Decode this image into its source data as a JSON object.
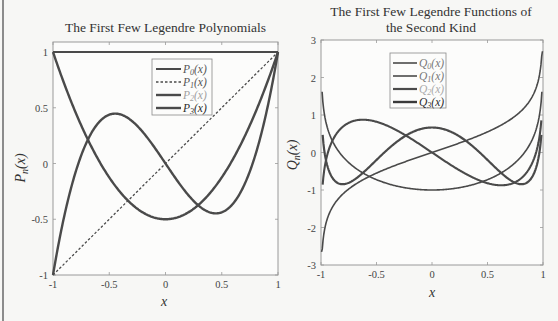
{
  "chart_data": [
    {
      "type": "line",
      "title": "The First Few Legendre Polynomials",
      "xlabel": "x",
      "ylabel": "P_n(x)",
      "xlim": [
        -1,
        1
      ],
      "ylim": [
        -1,
        1.1
      ],
      "xticks": [
        "-1",
        "-0.5",
        "0",
        "0.5",
        "1"
      ],
      "yticks": [
        "-1",
        "-0.5",
        "0",
        "0.5",
        "1"
      ],
      "grid": false,
      "legend_position": "upper center-right",
      "x": [
        -1,
        -0.75,
        -0.5,
        -0.25,
        0,
        0.25,
        0.5,
        0.75,
        1
      ],
      "series": [
        {
          "name": "P0(x)",
          "style": "solid",
          "values": [
            1,
            1,
            1,
            1,
            1,
            1,
            1,
            1,
            1
          ]
        },
        {
          "name": "P1(x)",
          "style": "dashed",
          "values": [
            -1,
            -0.75,
            -0.5,
            -0.25,
            0,
            0.25,
            0.5,
            0.75,
            1
          ]
        },
        {
          "name": "P2(x)",
          "style": "solid",
          "values": [
            1,
            0.34,
            -0.13,
            -0.41,
            -0.5,
            -0.41,
            -0.13,
            0.34,
            1
          ]
        },
        {
          "name": "P3(x)",
          "style": "solid",
          "values": [
            -1,
            0.07,
            0.44,
            0.34,
            0,
            -0.34,
            -0.44,
            -0.07,
            1
          ]
        }
      ]
    },
    {
      "type": "line",
      "title": "The First Few Legendre Functions of the Second Kind",
      "xlabel": "x",
      "ylabel": "Q_n(x)",
      "xlim": [
        -1,
        1
      ],
      "ylim": [
        -3,
        3
      ],
      "xticks": [
        "-1",
        "-0.5",
        "0",
        "0.5",
        "1"
      ],
      "yticks": [
        "-3",
        "-2",
        "-1",
        "0",
        "1",
        "2",
        "3"
      ],
      "grid": false,
      "legend_position": "upper center",
      "x": [
        -0.99,
        -0.75,
        -0.5,
        -0.25,
        0,
        0.25,
        0.5,
        0.75,
        0.99
      ],
      "series": [
        {
          "name": "Q0(x)",
          "values": [
            -2.65,
            -0.97,
            -0.55,
            -0.26,
            0,
            0.26,
            0.55,
            0.97,
            2.65
          ]
        },
        {
          "name": "Q1(x)",
          "values": [
            1.62,
            -0.27,
            -0.73,
            -0.94,
            -1,
            -0.94,
            -0.73,
            -0.27,
            1.62
          ]
        },
        {
          "name": "Q2(x)",
          "values": [
            -1.1,
            0.79,
            0.82,
            0.48,
            0,
            -0.48,
            -0.82,
            -0.79,
            1.1
          ]
        },
        {
          "name": "Q3(x)",
          "values": [
            0.7,
            -0.74,
            -0.2,
            0.43,
            0.67,
            0.43,
            -0.2,
            -0.74,
            0.7
          ]
        }
      ]
    }
  ],
  "left_chart": {
    "title": "The First Few Legendre Polynomials",
    "xlabel": "x",
    "ylabel_main": "P",
    "ylabel_sub": "n",
    "ylabel_tail": "(x)",
    "xticks": [
      "-1",
      "-0.5",
      "0",
      "0.5",
      "1"
    ],
    "yticks": [
      "-1",
      "-0.5",
      "0",
      "0.5",
      "1"
    ],
    "legend": [
      {
        "main": "P",
        "sub": "0",
        "tail": "(x)"
      },
      {
        "main": "P",
        "sub": "1",
        "tail": "(x)"
      },
      {
        "main": "P",
        "sub": "2",
        "tail": "(x)"
      },
      {
        "main": "P",
        "sub": "3",
        "tail": "(x)"
      }
    ]
  },
  "right_chart": {
    "title_line1": "The First Few Legendre Functions of",
    "title_line2": "the Second Kind",
    "xlabel": "x",
    "ylabel_main": "Q",
    "ylabel_sub": "n",
    "ylabel_tail": "(x)",
    "xticks": [
      "-1",
      "-0.5",
      "0",
      "0.5",
      "1"
    ],
    "yticks": [
      "-3",
      "-2",
      "-1",
      "0",
      "1",
      "2",
      "3"
    ],
    "legend": [
      {
        "main": "Q",
        "sub": "0",
        "tail": "(x)"
      },
      {
        "main": "Q",
        "sub": "1",
        "tail": "(x)"
      },
      {
        "main": "Q",
        "sub": "2",
        "tail": "(x)"
      },
      {
        "main": "Q",
        "sub": "3",
        "tail": "(x)"
      }
    ]
  },
  "colors": {
    "curve": "#4a4a4a",
    "frame": "#9a9a9a",
    "legend_faded": "#9a9a9a",
    "text": "#333333"
  }
}
